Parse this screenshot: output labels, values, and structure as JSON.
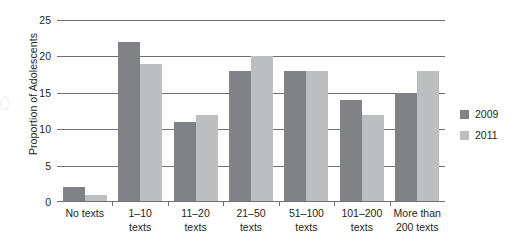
{
  "chart_data": {
    "type": "bar",
    "title": "",
    "xlabel": "",
    "ylabel": "Proportion of Adolescents",
    "ylim": [
      0,
      25
    ],
    "yticks": [
      0,
      5,
      10,
      15,
      20,
      25
    ],
    "grid": true,
    "legend_position": "right",
    "categories": [
      "No texts",
      "1–10 texts",
      "11–20 texts",
      "21–50 texts",
      "51–100 texts",
      "101–200 texts",
      "More than 200 texts"
    ],
    "category_lines": [
      [
        "No texts"
      ],
      [
        "1–10",
        "texts"
      ],
      [
        "11–20",
        "texts"
      ],
      [
        "21–50",
        "texts"
      ],
      [
        "51–100",
        "texts"
      ],
      [
        "101–200",
        "texts"
      ],
      [
        "More than",
        "200 texts"
      ]
    ],
    "series": [
      {
        "name": "2009",
        "color": "#808285",
        "values": [
          2,
          22,
          11,
          18,
          18,
          14,
          15
        ]
      },
      {
        "name": "2011",
        "color": "#bcbec0",
        "values": [
          1,
          19,
          12,
          20,
          18,
          12,
          18
        ]
      }
    ]
  },
  "legend": {
    "items": [
      {
        "label": "2009",
        "color": "#808285"
      },
      {
        "label": "2011",
        "color": "#bcbec0"
      }
    ]
  }
}
